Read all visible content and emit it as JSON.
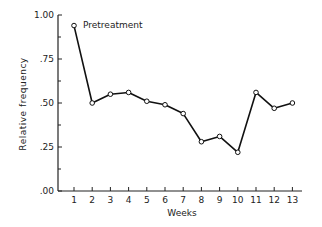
{
  "chart_data": {
    "type": "line",
    "title": "",
    "xlabel": "Weeks",
    "ylabel": "Relative frequency",
    "ylim": [
      0,
      1.0
    ],
    "xlim": [
      0,
      13.5
    ],
    "grid": false,
    "legend": null,
    "x": [
      1,
      2,
      3,
      4,
      5,
      6,
      7,
      8,
      9,
      10,
      11,
      12,
      13
    ],
    "y_ticks": [
      ".00",
      ".25",
      ".50",
      ".75",
      "1.00"
    ],
    "x_ticks": [
      "1",
      "2",
      "3",
      "4",
      "5",
      "6",
      "7",
      "8",
      "9",
      "10",
      "11",
      "12",
      "13"
    ],
    "series": [
      {
        "name": "Relative frequency",
        "values": [
          0.94,
          0.5,
          0.55,
          0.56,
          0.51,
          0.49,
          0.44,
          0.28,
          0.31,
          0.22,
          0.56,
          0.47,
          0.5
        ],
        "marker": "open-circle",
        "color": "#111111"
      }
    ],
    "annotations": [
      {
        "text": "Pretreatment",
        "x": 1,
        "y": 0.94
      }
    ]
  }
}
